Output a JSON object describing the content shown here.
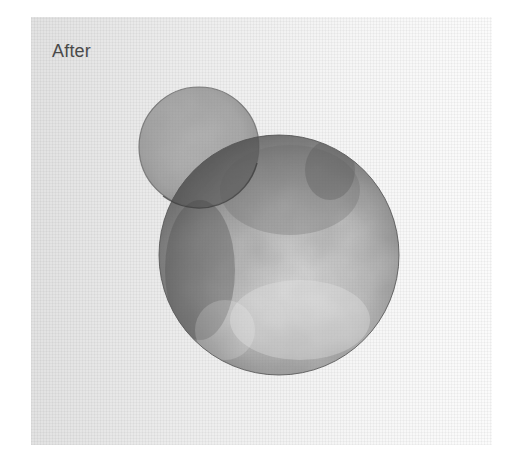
{
  "image": {
    "label": "After",
    "description": "Watercolor study of two overlapping gray circles on textured paper",
    "colors": {
      "paper": "#ececec",
      "ink_dark": "#3a3a3a",
      "ink_mid": "#8a8a8a",
      "outline": "#555555",
      "label_text": "#4a4a4a"
    },
    "shapes": [
      {
        "name": "small-circle",
        "cx": 199,
        "cy": 147,
        "r": 60
      },
      {
        "name": "large-circle",
        "cx": 279,
        "cy": 255,
        "r": 120
      }
    ]
  }
}
